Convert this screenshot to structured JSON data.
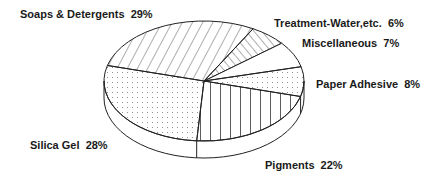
{
  "chart_data": {
    "type": "pie",
    "style": "3d-exploded-none",
    "title": "",
    "start_angle_deg": 15,
    "direction": "clockwise",
    "slices": [
      {
        "label": "Pigments",
        "value": 22,
        "pattern": "vertical-lines",
        "label_text": "Pigments  22%",
        "lx": 265,
        "ly": 169
      },
      {
        "label": "Silica Gel",
        "value": 28,
        "pattern": "dots",
        "label_text": "Silica Gel  28%",
        "lx": 30,
        "ly": 149
      },
      {
        "label": "Soaps & Detergents",
        "value": 29,
        "pattern": "diagonal-lines",
        "label_text": "Soaps & Detergents  29%",
        "lx": 20,
        "ly": 18
      },
      {
        "label": "Treatment-Water,etc.",
        "value": 6,
        "pattern": "back-diagonal-lines",
        "label_text": "Treatment-Water,etc.  6%",
        "lx": 274,
        "ly": 27
      },
      {
        "label": "Miscellaneous",
        "value": 7,
        "pattern": "blank",
        "label_text": "Miscellaneous  7%",
        "lx": 302,
        "ly": 47
      },
      {
        "label": "Paper Adhesive",
        "value": 8,
        "pattern": "dots",
        "label_text": "Paper Adhesive  8%",
        "lx": 316,
        "ly": 88
      }
    ],
    "geometry": {
      "cx": 204,
      "cy": 81,
      "rx": 100,
      "ry": 60,
      "depth": 17
    },
    "colors": {
      "stroke": "#222222",
      "fill": "#ffffff",
      "text": "#1a1a1a"
    }
  }
}
